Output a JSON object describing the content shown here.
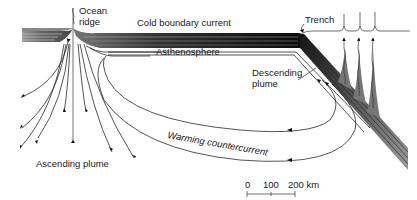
{
  "diagram": {
    "labels": {
      "ocean_ridge_line1": "Ocean",
      "ocean_ridge_line2": "ridge",
      "cold_boundary_current": "Cold boundary current",
      "trench": "Trench",
      "asthenosphere": "Asthenosphere",
      "descending_plume_line1": "Descending",
      "descending_plume_line2": "plume",
      "warming_countercurrent": "Warming countercurrent",
      "ascending_plume": "Ascending plume"
    },
    "scale_bar": {
      "ticks": [
        "0",
        "100",
        "200 km"
      ],
      "unit": "km"
    },
    "colors": {
      "plate_dark": "#111111",
      "plate_light": "#8a8a8a",
      "line": "#2a2a2a",
      "background": "#ffffff"
    }
  }
}
